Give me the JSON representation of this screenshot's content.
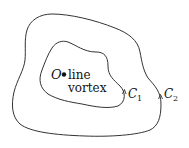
{
  "diagram": {
    "point_label": "O",
    "vortex_label_line1": "line",
    "vortex_label_line2": "vortex",
    "inner_contour": {
      "label": "C",
      "subscript": "1"
    },
    "outer_contour": {
      "label": "C",
      "subscript": "2"
    },
    "stroke_color": "#333333"
  }
}
